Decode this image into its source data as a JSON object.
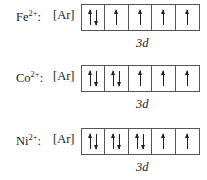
{
  "rows": [
    {
      "ion": {
        "symbol": "Fe",
        "charge": "2+",
        "suffix": ":"
      },
      "core": "[Ar]",
      "subshell_label": "3d",
      "orbitals": [
        "up-down",
        "up",
        "up",
        "up",
        "up"
      ]
    },
    {
      "ion": {
        "symbol": "Co",
        "charge": "2+",
        "suffix": ":"
      },
      "core": "[Ar]",
      "subshell_label": "3d",
      "orbitals": [
        "up-down",
        "up-down",
        "up",
        "up",
        "up"
      ]
    },
    {
      "ion": {
        "symbol": "Ni",
        "charge": "2+",
        "suffix": ":"
      },
      "core": "[Ar]",
      "subshell_label": "3d",
      "orbitals": [
        "up-down",
        "up-down",
        "up-down",
        "up",
        "up"
      ]
    }
  ]
}
